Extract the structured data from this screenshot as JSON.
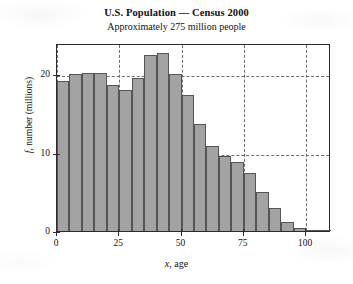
{
  "chart_data": {
    "type": "bar",
    "title": "U.S. Population — Census 2000",
    "subtitle": "Approximately 275 million people",
    "xlabel": "x, age",
    "xlabel_var": "x",
    "xlabel_rest": ", age",
    "ylabel": "f, number (millions)",
    "ylabel_var": "f",
    "ylabel_rest": ", number (millions)",
    "xlim": [
      0,
      110
    ],
    "ylim": [
      0,
      24
    ],
    "bin_width": 5,
    "grid": "dashed gridlines at x = 0, 25, 50, 75, 100 and y = 0, 10, 20",
    "legend": "none",
    "bar_color": "#a3a3a3",
    "bar_edge_color": "#555555",
    "xticks": [
      0,
      25,
      50,
      75,
      100
    ],
    "yticks": [
      0,
      10,
      20
    ],
    "categories": [
      "0-5",
      "5-10",
      "10-15",
      "15-20",
      "20-25",
      "25-30",
      "30-35",
      "35-40",
      "40-45",
      "45-50",
      "50-55",
      "55-60",
      "60-65",
      "65-70",
      "70-75",
      "75-80",
      "80-85",
      "85-90",
      "90-95",
      "95-100",
      "100-105",
      "105-110"
    ],
    "bin_starts": [
      0,
      5,
      10,
      15,
      20,
      25,
      30,
      35,
      40,
      45,
      50,
      55,
      60,
      65,
      70,
      75,
      80,
      85,
      90,
      95,
      100,
      105
    ],
    "values": [
      19.2,
      20.1,
      20.2,
      20.2,
      18.6,
      18.0,
      19.5,
      22.5,
      22.7,
      20.0,
      17.3,
      13.6,
      10.9,
      9.6,
      8.8,
      7.4,
      5.0,
      3.0,
      1.2,
      0.4,
      0.1,
      0.05
    ]
  },
  "axes": {
    "ytick_labels": [
      "0",
      "10",
      "20"
    ],
    "xtick_labels": [
      "0",
      "25",
      "50",
      "75",
      "100"
    ]
  }
}
